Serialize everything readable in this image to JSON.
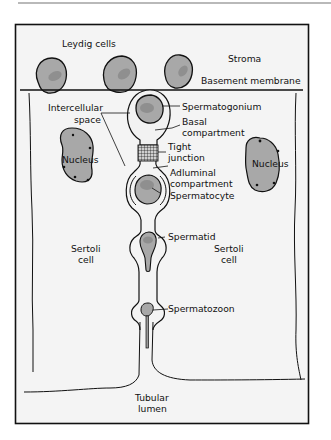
{
  "figure": {
    "colors": {
      "background": "#f4f4f4",
      "outline": "#111111",
      "cell_fill": "#a8a8a8",
      "nucleus_fill": "#9a9a9a",
      "inner_nucleus": "#8c8c8c",
      "compartment_fill": "#f2f2f2",
      "top_rule": "#b9b9b9"
    }
  },
  "labels": {
    "leydig_cells": "Leydig cells",
    "stroma": "Stroma",
    "basement_membrane": "Basement membrane",
    "intercellular_space_line1": "Intercellular",
    "intercellular_space_line2": "space",
    "spermatogonium": "Spermatogonium",
    "basal_compartment_line1": "Basal",
    "basal_compartment_line2": "compartment",
    "tight_junction_line1": "Tight",
    "tight_junction_line2": "junction",
    "adluminal_compartment_line1": "Adluminal",
    "adluminal_compartment_line2": "compartment",
    "spermatocyte": "Spermatocyte",
    "spermatid": "Spermatid",
    "spermatozoon": "Spermatozoon",
    "nucleus_left": "Nucleus",
    "nucleus_right": "Nucleus",
    "sertoli_left_line1": "Sertoli",
    "sertoli_left_line2": "cell",
    "sertoli_right_line1": "Sertoli",
    "sertoli_right_line2": "cell",
    "tubular_lumen_line1": "Tubular",
    "tubular_lumen_line2": "lumen"
  }
}
